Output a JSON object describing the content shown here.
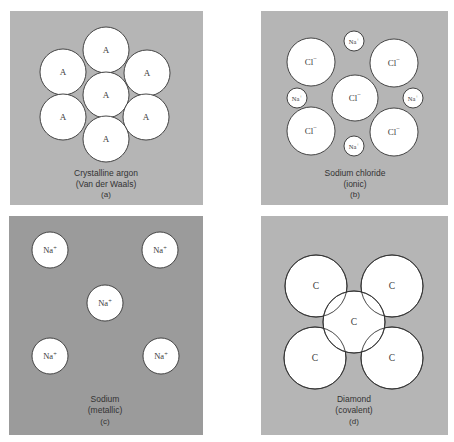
{
  "colors": {
    "page_bg": "#ffffff",
    "panel_light": "#b5b5b5",
    "panel_dark": "#9b9b9b",
    "atom_fill": "#ffffff",
    "atom_stroke": "#333333",
    "text": "#333333"
  },
  "panels": [
    {
      "id": "a",
      "caption_line1": "Crystalline argon",
      "caption_line2": "(Van der Waals)",
      "letter": "(a)",
      "bond_type": "Van der Waals",
      "atoms": [
        {
          "label": "A",
          "cx": 106,
          "cy": 50,
          "r": 23
        },
        {
          "label": "A",
          "cx": 63,
          "cy": 72,
          "r": 23
        },
        {
          "label": "A",
          "cx": 147,
          "cy": 73,
          "r": 23
        },
        {
          "label": "A",
          "cx": 106,
          "cy": 95,
          "r": 23
        },
        {
          "label": "A",
          "cx": 63,
          "cy": 117,
          "r": 23
        },
        {
          "label": "A",
          "cx": 146,
          "cy": 117,
          "r": 23
        },
        {
          "label": "A",
          "cx": 106,
          "cy": 139,
          "r": 23
        }
      ]
    },
    {
      "id": "b",
      "caption_line1": "Sodium chloride",
      "caption_line2": "(ionic)",
      "letter": "(b)",
      "bond_type": "ionic",
      "atoms": [
        {
          "label": "Cl",
          "charge": "−",
          "cx": 311,
          "cy": 62,
          "r": 24
        },
        {
          "label": "Cl",
          "charge": "−",
          "cx": 394,
          "cy": 63,
          "r": 24
        },
        {
          "label": "Cl",
          "charge": "−",
          "cx": 355,
          "cy": 98,
          "r": 23
        },
        {
          "label": "Cl",
          "charge": "−",
          "cx": 311,
          "cy": 131,
          "r": 24
        },
        {
          "label": "Cl",
          "charge": "−",
          "cx": 394,
          "cy": 132,
          "r": 24
        },
        {
          "label": "Na",
          "charge": "+",
          "cx": 354,
          "cy": 41,
          "r": 10
        },
        {
          "label": "Na",
          "charge": "+",
          "cx": 297,
          "cy": 98,
          "r": 10
        },
        {
          "label": "Na",
          "charge": "+",
          "cx": 413,
          "cy": 98,
          "r": 10
        },
        {
          "label": "Na",
          "charge": "+",
          "cx": 354,
          "cy": 146,
          "r": 10
        }
      ]
    },
    {
      "id": "c",
      "caption_line1": "Sodium",
      "caption_line2": "(metallic)",
      "letter": "(c)",
      "bond_type": "metallic",
      "atoms": [
        {
          "label": "Na",
          "charge": "+",
          "cx": 50,
          "cy": 250,
          "r": 18
        },
        {
          "label": "Na",
          "charge": "+",
          "cx": 160,
          "cy": 250,
          "r": 18
        },
        {
          "label": "Na",
          "charge": "+",
          "cx": 105,
          "cy": 303,
          "r": 18
        },
        {
          "label": "Na",
          "charge": "+",
          "cx": 50,
          "cy": 356,
          "r": 18
        },
        {
          "label": "Na",
          "charge": "+",
          "cx": 161,
          "cy": 356,
          "r": 18
        }
      ]
    },
    {
      "id": "d",
      "caption_line1": "Diamond",
      "caption_line2": "(covalent)",
      "letter": "(d)",
      "bond_type": "covalent",
      "atoms": [
        {
          "label": "C",
          "cx": 316,
          "cy": 286,
          "r": 31
        },
        {
          "label": "C",
          "cx": 392,
          "cy": 286,
          "r": 31
        },
        {
          "label": "C",
          "cx": 315,
          "cy": 358,
          "r": 31
        },
        {
          "label": "C",
          "cx": 392,
          "cy": 358,
          "r": 31
        },
        {
          "label": "C",
          "cx": 354,
          "cy": 322,
          "r": 31
        }
      ]
    }
  ]
}
